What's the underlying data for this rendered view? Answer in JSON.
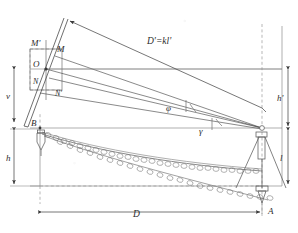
{
  "figure": {
    "kind": "surveying-geometry-diagram",
    "background": "#ffffff",
    "ink": "#3a3a3a",
    "ink_light": "#9a9a9a",
    "width": 298,
    "height": 233
  },
  "labels": {
    "m_prime": "M'",
    "m": "M",
    "o": "O",
    "n": "N",
    "n_prime": "N'",
    "b": "B",
    "a": "A",
    "v": "v",
    "h": "h",
    "h_prime": "h'",
    "l": "l",
    "d": "D",
    "d_prime": "D'=kl'",
    "phi": "φ",
    "gamma": "γ"
  },
  "dimensions": [
    {
      "name": "v",
      "label": "v",
      "orientation": "vertical",
      "side": "left"
    },
    {
      "name": "h",
      "label": "h",
      "orientation": "vertical",
      "side": "left"
    },
    {
      "name": "h-prime",
      "label": "h'",
      "orientation": "vertical",
      "side": "right"
    },
    {
      "name": "l",
      "label": "l",
      "orientation": "vertical",
      "side": "right"
    },
    {
      "name": "D",
      "label": "D",
      "orientation": "horizontal",
      "side": "bottom"
    },
    {
      "name": "D-prime",
      "label": "D'=kl'",
      "orientation": "oblique",
      "side": "top"
    }
  ],
  "angles": [
    {
      "name": "phi",
      "label": "φ"
    },
    {
      "name": "gamma",
      "label": "γ"
    }
  ],
  "points": [
    {
      "name": "M-prime",
      "label": "M'"
    },
    {
      "name": "M",
      "label": "M"
    },
    {
      "name": "O",
      "label": "O"
    },
    {
      "name": "N",
      "label": "N"
    },
    {
      "name": "N-prime",
      "label": "N'"
    },
    {
      "name": "B",
      "label": "B"
    },
    {
      "name": "A",
      "label": "A"
    }
  ]
}
